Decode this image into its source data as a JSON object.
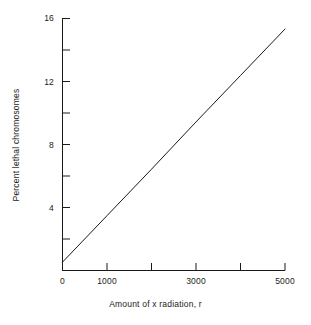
{
  "chart_data": {
    "type": "line",
    "title": "",
    "subtitle": "",
    "xlabel": "Amount of x radiation, r",
    "ylabel": "Percent lethal chromosomes",
    "xlim": [
      0,
      5000
    ],
    "ylim": [
      0,
      16
    ],
    "grid": false,
    "legend": null,
    "x_major_ticks": [
      0,
      1000,
      2000,
      3000,
      4000,
      5000
    ],
    "x_tick_labels": [
      "0",
      "1000",
      "",
      "3000",
      "",
      "5000"
    ],
    "y_major_ticks": [
      0,
      2,
      4,
      6,
      8,
      10,
      12,
      14,
      16
    ],
    "y_tick_labels": [
      "0",
      "",
      "4",
      "",
      "8",
      "",
      "12",
      "",
      "16"
    ],
    "series": [
      {
        "name": "lethal chromosomes vs dose",
        "x": [
          0,
          1000,
          2000,
          3000,
          4000,
          5000
        ],
        "values": [
          0.5,
          3.45,
          6.4,
          9.4,
          12.35,
          15.3
        ],
        "color": "#1a1a1a",
        "line_width": 1
      }
    ],
    "annotations": []
  },
  "axis_labels": {
    "x_title": "Amount of x radiation, r",
    "y_title": "Percent lethal chromosomes",
    "x_ticks": [
      {
        "value": 0,
        "label": "0"
      },
      {
        "value": 1000,
        "label": "1000"
      },
      {
        "value": 3000,
        "label": "3000"
      },
      {
        "value": 5000,
        "label": "5000"
      }
    ],
    "y_ticks": [
      {
        "value": 4,
        "label": "4"
      },
      {
        "value": 8,
        "label": "8"
      },
      {
        "value": 12,
        "label": "12"
      },
      {
        "value": 16,
        "label": "16"
      }
    ]
  }
}
